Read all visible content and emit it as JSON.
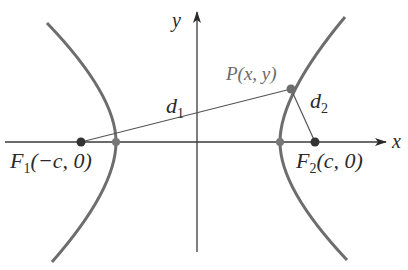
{
  "diagram": {
    "type": "hyperbola-foci-definition",
    "colors": {
      "background": "#ffffff",
      "curve": "#6d6d6d",
      "axes": "#3a3a3a",
      "segments": "#555555",
      "focus_point": "#333333",
      "vertex_point": "#777777",
      "label_dark": "#2a2a2a",
      "label_grey": "#6a6a6a"
    },
    "axes": {
      "x_label": "x",
      "y_label": "y"
    },
    "points": {
      "f1": {
        "name": "F",
        "sub": "1",
        "coords": "(−c, 0)"
      },
      "f2": {
        "name": "F",
        "sub": "2",
        "coords": "(c, 0)"
      },
      "p": {
        "label": "P(x, y)"
      }
    },
    "segments": {
      "d1": {
        "name": "d",
        "sub": "1"
      },
      "d2": {
        "name": "d",
        "sub": "2"
      }
    }
  }
}
